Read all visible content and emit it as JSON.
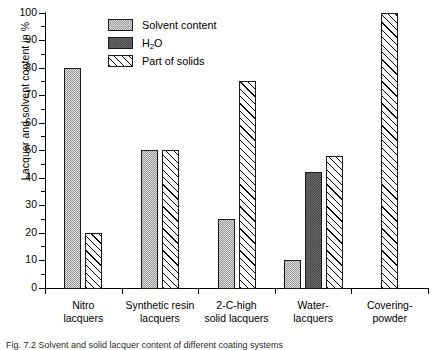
{
  "chart_data": {
    "type": "bar",
    "title": "",
    "xlabel": "",
    "ylabel": "Lacquer and solvent content in %",
    "ylim": [
      0,
      100
    ],
    "ytick_step": 10,
    "yminor_step": 5,
    "grid": false,
    "legend_position": "top-left-inside",
    "categories": [
      "Nitro lacquers",
      "Synthetic resin lacquers",
      "2-C-high solid lacquers",
      "Water-lacquers",
      "Covering-powder"
    ],
    "series": [
      {
        "name": "Solvent content",
        "values": [
          80,
          50,
          25,
          10,
          null
        ]
      },
      {
        "name": "H2O",
        "values": [
          null,
          null,
          null,
          42,
          null
        ]
      },
      {
        "name": "Part of solids",
        "values": [
          20,
          50,
          75,
          48,
          100
        ]
      }
    ],
    "yticks": [
      "0",
      "10",
      "20",
      "30",
      "40",
      "50",
      "60",
      "70",
      "80",
      "90",
      "100"
    ]
  },
  "legend": {
    "items": [
      {
        "label": "Solvent content",
        "pattern": "light-stipple"
      },
      {
        "label_main": "H",
        "label_sub": "2",
        "label_tail": "O",
        "pattern": "dark-checker"
      },
      {
        "label": "Part of solids",
        "pattern": "diagonal-hatch"
      }
    ]
  },
  "xaxis": {
    "categories": [
      {
        "line1": "Nitro",
        "line2": "lacquers"
      },
      {
        "line1": "Synthetic resin",
        "line2": "lacquers"
      },
      {
        "line1": "2-C-high",
        "line2": "solid lacquers"
      },
      {
        "line1": "Water-",
        "line2": "lacquers"
      },
      {
        "line1": "Covering-",
        "line2": "powder"
      }
    ]
  },
  "caption": {
    "text": "Fig. 7.2 Solvent and solid lacquer content of different coating systems"
  }
}
